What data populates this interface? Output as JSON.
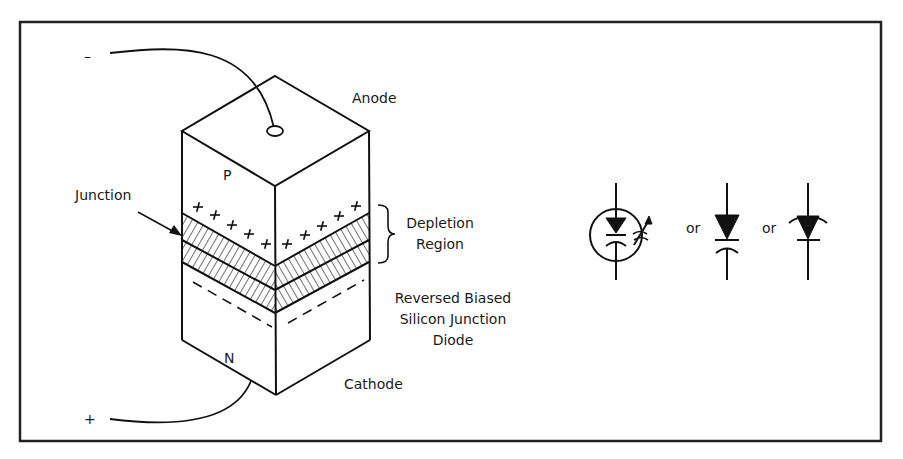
{
  "diagram": {
    "title": "Reversed Biased Silicon Junction Diode",
    "labels": {
      "anode": "Anode",
      "cathode": "Cathode",
      "p_region": "P",
      "n_region": "N",
      "junction": "Junction",
      "depletion_line1": "Depletion",
      "depletion_line2": "Region",
      "caption_line1": "Reversed Biased",
      "caption_line2": "Silicon Junction",
      "caption_line3": "Diode",
      "minus_terminal": "–",
      "plus_terminal": "+",
      "or1": "or",
      "or2": "or"
    },
    "symbols": [
      {
        "name": "varactor-symbol-circled",
        "description": "diode with capacitor plate and variable arrow in circle"
      },
      {
        "name": "varactor-symbol-capacitor",
        "description": "diode with curved capacitor plate"
      },
      {
        "name": "varactor-symbol-curved",
        "description": "diode with curved anode plate"
      }
    ]
  }
}
